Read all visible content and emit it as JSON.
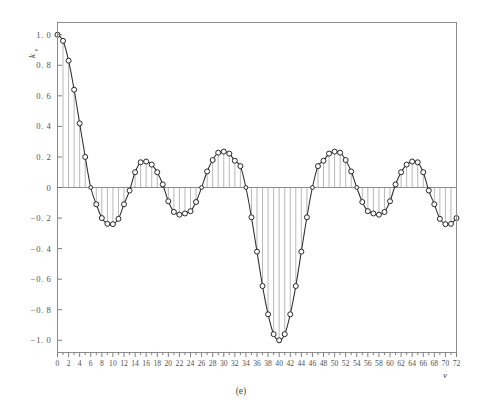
{
  "figure": {
    "caption": "(e)",
    "xlabel": "ν",
    "ylabel_base": "k",
    "ylabel_sub": "ν",
    "axis_color": "#8d8d8d",
    "curve_color": "#2c2c2c",
    "stem_color": "#9a9a9a",
    "marker_fill": "#ffffff",
    "background": "#ffffff"
  },
  "chart_data": {
    "type": "line",
    "title": "",
    "subtitle": "",
    "xlabel": "ν",
    "ylabel": "kν",
    "xlim": [
      0,
      72
    ],
    "ylim": [
      -1.08,
      1.08
    ],
    "grid": false,
    "legend": null,
    "marker": "open-circle",
    "stems_to_zero": true,
    "xticks": [
      0,
      2,
      4,
      6,
      8,
      10,
      12,
      14,
      16,
      18,
      20,
      22,
      24,
      26,
      28,
      30,
      32,
      34,
      36,
      38,
      40,
      42,
      44,
      46,
      48,
      50,
      52,
      54,
      56,
      58,
      60,
      62,
      64,
      66,
      68,
      70,
      72
    ],
    "xticklabels": [
      "0",
      "2",
      "4",
      "6",
      "8",
      "10",
      "12",
      "14",
      "16",
      "18",
      "20",
      "22",
      "24",
      "26",
      "28",
      "30",
      "32",
      "34",
      "36",
      "38",
      "40",
      "42",
      "44",
      "46",
      "48",
      "50",
      "52",
      "54",
      "56",
      "58",
      "60",
      "62",
      "64",
      "66",
      "68",
      "70",
      "72"
    ],
    "xminorticks": [
      1,
      3,
      5,
      7,
      9,
      11,
      13,
      15,
      17,
      19,
      21,
      23,
      25,
      27,
      29,
      31,
      33,
      35,
      37,
      39,
      41,
      43,
      45,
      47,
      49,
      51,
      53,
      55,
      57,
      59,
      61,
      63,
      65,
      67,
      69,
      71
    ],
    "yticks": [
      -1.0,
      -0.8,
      -0.6,
      -0.4,
      -0.2,
      0,
      0.2,
      0.4,
      0.6,
      0.8,
      1.0
    ],
    "yticklabels": [
      "−1. 0",
      "−0. 8",
      "−0. 6",
      "−0. 4",
      "−0. 2",
      "0",
      "0. 2",
      "0. 4",
      "0. 6",
      "0. 8",
      "1. 0"
    ],
    "x": [
      0,
      1,
      2,
      3,
      4,
      5,
      6,
      7,
      8,
      9,
      10,
      11,
      12,
      13,
      14,
      15,
      16,
      17,
      18,
      19,
      20,
      21,
      22,
      23,
      24,
      25,
      26,
      27,
      28,
      29,
      30,
      31,
      32,
      33,
      34,
      35,
      36,
      37,
      38,
      39,
      40,
      41,
      42,
      43,
      44,
      45,
      46,
      47,
      48,
      49,
      50,
      51,
      52,
      53,
      54,
      55,
      56,
      57,
      58,
      59,
      60,
      61,
      62,
      63,
      64,
      65,
      66,
      67,
      68,
      69,
      70,
      71,
      72
    ],
    "values": [
      1.0,
      0.96,
      0.83,
      0.64,
      0.42,
      0.2,
      0.0,
      -0.11,
      -0.2,
      -0.238,
      -0.24,
      -0.205,
      -0.11,
      -0.02,
      0.1,
      0.165,
      0.17,
      0.15,
      0.1,
      0.02,
      -0.09,
      -0.16,
      -0.178,
      -0.17,
      -0.155,
      -0.095,
      0.0,
      0.105,
      0.18,
      0.228,
      0.235,
      0.222,
      0.175,
      0.14,
      0.0,
      -0.195,
      -0.42,
      -0.645,
      -0.83,
      -0.96,
      -1.0,
      -0.96,
      -0.83,
      -0.645,
      -0.42,
      -0.195,
      0.0,
      0.14,
      0.175,
      0.222,
      0.235,
      0.228,
      0.18,
      0.105,
      0.0,
      -0.095,
      -0.155,
      -0.17,
      -0.178,
      -0.16,
      -0.09,
      0.02,
      0.1,
      0.15,
      0.17,
      0.165,
      0.1,
      -0.02,
      -0.11,
      -0.205,
      -0.24,
      -0.238,
      -0.2
    ]
  }
}
